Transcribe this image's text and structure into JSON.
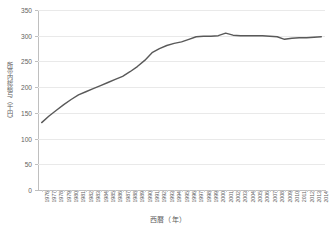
{
  "chart_data": {
    "type": "line",
    "title": "",
    "xlabel": "西暦（年）",
    "ylabel": "所帯内総給与（千円）",
    "ylim": [
      0,
      350
    ],
    "yticks": [
      0,
      50,
      100,
      150,
      200,
      250,
      300,
      350
    ],
    "grid": true,
    "legend": false,
    "series_color": "#595959",
    "categories": [
      "1976",
      "1977",
      "1978",
      "1979",
      "1980",
      "1981",
      "1982",
      "1983",
      "1984",
      "1985",
      "1986",
      "1987",
      "1988",
      "1989",
      "1990",
      "1991",
      "1992",
      "1993",
      "1994",
      "1995",
      "1996",
      "1997",
      "1998",
      "1999",
      "2000",
      "2001",
      "2002",
      "2003",
      "2004",
      "2005",
      "2006",
      "2007",
      "2008",
      "2009",
      "2010",
      "2011",
      "2012",
      "2013",
      "2014"
    ],
    "series": [
      {
        "name": "所帯内総給与",
        "values": [
          131,
          144,
          155,
          166,
          176,
          185,
          191,
          197,
          203,
          209,
          215,
          221,
          230,
          240,
          252,
          267,
          275,
          281,
          285,
          288,
          293,
          298,
          299,
          299,
          300,
          305,
          301,
          300,
          300,
          300,
          300,
          299,
          298,
          293,
          295,
          296,
          296,
          297,
          298
        ]
      }
    ]
  },
  "axes": {
    "y_title": "所帯内総給与（千円）",
    "x_title": "西暦（年）"
  }
}
